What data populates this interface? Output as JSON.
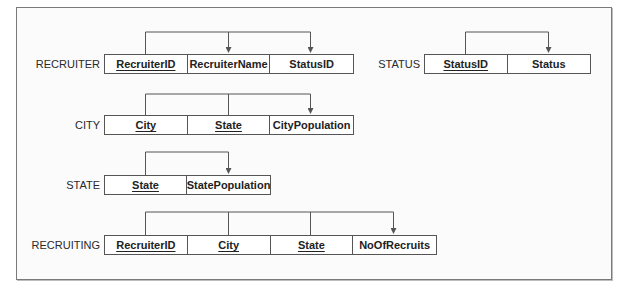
{
  "relations": [
    {
      "name": "RECRUITER",
      "columns": [
        {
          "label": "RecruiterID",
          "primary_key": true
        },
        {
          "label": "RecruiterName",
          "primary_key": false
        },
        {
          "label": "StatusID",
          "primary_key": false
        }
      ],
      "dependencies": "RecruiterID -> RecruiterName, StatusID"
    },
    {
      "name": "STATUS",
      "columns": [
        {
          "label": "StatusID",
          "primary_key": true
        },
        {
          "label": "Status",
          "primary_key": false
        }
      ],
      "dependencies": "StatusID -> Status"
    },
    {
      "name": "CITY",
      "columns": [
        {
          "label": "City",
          "primary_key": true
        },
        {
          "label": "State",
          "primary_key": true
        },
        {
          "label": "CityPopulation",
          "primary_key": false
        }
      ],
      "dependencies": "City, State -> CityPopulation"
    },
    {
      "name": "STATE",
      "columns": [
        {
          "label": "State",
          "primary_key": true
        },
        {
          "label": "StatePopulation",
          "primary_key": false
        }
      ],
      "dependencies": "State -> StatePopulation"
    },
    {
      "name": "RECRUITING",
      "columns": [
        {
          "label": "RecruiterID",
          "primary_key": true
        },
        {
          "label": "City",
          "primary_key": true
        },
        {
          "label": "State",
          "primary_key": true
        },
        {
          "label": "NoOfRecruits",
          "primary_key": false
        }
      ],
      "dependencies": "RecruiterID, City, State -> NoOfRecruits"
    }
  ],
  "colors": {
    "line": "#555555",
    "frame": "#7a7a7a",
    "text": "#222222"
  }
}
